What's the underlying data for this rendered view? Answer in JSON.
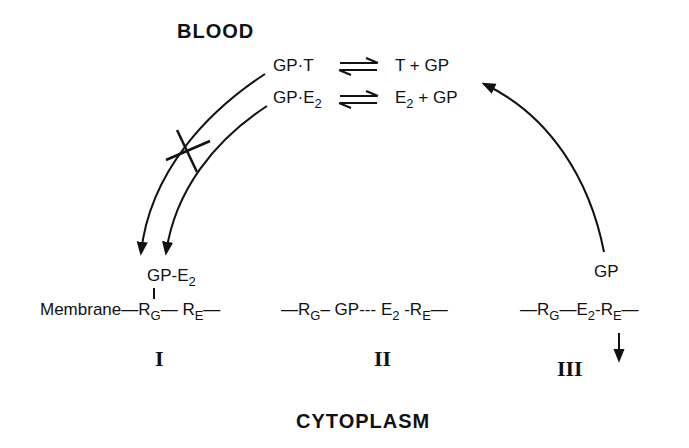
{
  "diagram": {
    "regions": {
      "top": "BLOOD",
      "bottom": "CYTOPLASM"
    },
    "equilibria": [
      {
        "left": "GP·T",
        "arrow": "⇌",
        "right": "T + GP"
      },
      {
        "left_main": "GP·E",
        "left_sub": "2",
        "arrow": "⇌",
        "right_main": "E",
        "right_sub": "2",
        "right_tail": " + GP"
      }
    ],
    "complex_I": {
      "label": "I",
      "bound_main": "GP-E",
      "bound_sub": "2",
      "membrane": "Membrane",
      "rg": "R",
      "rg_sub": "G",
      "re": "R",
      "re_sub": "E",
      "tether": "|"
    },
    "complex_II": {
      "label": "II",
      "rg": "R",
      "rg_sub": "G",
      "gp": "GP",
      "dots": "---",
      "e2": "E",
      "e2_sub": "2",
      "re": "R",
      "re_sub": "E"
    },
    "complex_III": {
      "label": "III",
      "released": "GP",
      "rg": "R",
      "rg_sub": "G",
      "e2": "E",
      "e2_sub": "2",
      "re": "R",
      "re_sub": "E"
    },
    "arrows": [
      {
        "from": "GP·T",
        "to": "complex I",
        "blocked": true
      },
      {
        "from": "GP·E2",
        "to": "complex I",
        "blocked": false
      },
      {
        "from": "complex III GP",
        "to": "T + GP / E2 + GP",
        "blocked": false
      },
      {
        "from": "complex III RE",
        "to": "cytoplasm (down)",
        "blocked": false
      }
    ]
  }
}
